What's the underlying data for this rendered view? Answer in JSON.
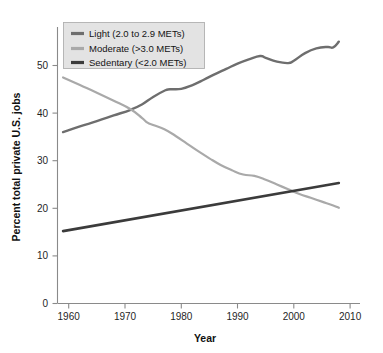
{
  "chart_data": {
    "type": "line",
    "title": "",
    "xlabel": "Year",
    "ylabel": "Percent total private U.S. jobs",
    "xlim": [
      1958,
      2010
    ],
    "ylim": [
      0,
      57
    ],
    "xticks": [
      1960,
      1970,
      1980,
      1990,
      2000,
      2010
    ],
    "xtick_labels": [
      "1960",
      "1970",
      "1980",
      "1990",
      "2000",
      "2010"
    ],
    "yticks": [
      0,
      10,
      20,
      30,
      40,
      50
    ],
    "ytick_labels": [
      "0",
      "10",
      "20",
      "30",
      "40",
      "50"
    ],
    "grid": false,
    "legend_position": "top-left",
    "series": [
      {
        "name": "Light (2.0 to 2.9 METs)",
        "color": "#6e6e6e",
        "x": [
          1959,
          1962,
          1965,
          1968,
          1971,
          1973,
          1975,
          1977,
          1978,
          1980,
          1982,
          1984,
          1986,
          1988,
          1990,
          1992,
          1994,
          1995,
          1997,
          1999,
          2000,
          2002,
          2004,
          2006,
          2007,
          2008
        ],
        "values": [
          36.0,
          37.2,
          38.3,
          39.5,
          40.7,
          41.8,
          43.4,
          44.7,
          45.0,
          45.1,
          45.9,
          47.0,
          48.2,
          49.3,
          50.4,
          51.3,
          52.0,
          51.6,
          50.8,
          50.5,
          51.0,
          52.6,
          53.6,
          53.9,
          53.8,
          55.0
        ]
      },
      {
        "name": "Moderate (>3.0 METs)",
        "color": "#a9a9a9",
        "x": [
          1959,
          1962,
          1965,
          1968,
          1971,
          1973,
          1974,
          1975,
          1977,
          1979,
          1981,
          1983,
          1985,
          1987,
          1989,
          1991,
          1993,
          1995,
          1997,
          1999,
          2001,
          2003,
          2005,
          2007,
          2008
        ],
        "values": [
          47.5,
          45.9,
          44.3,
          42.6,
          40.8,
          39.0,
          38.0,
          37.5,
          36.6,
          35.2,
          33.6,
          32.0,
          30.5,
          29.1,
          28.0,
          27.1,
          26.8,
          26.0,
          25.0,
          24.0,
          23.0,
          22.2,
          21.4,
          20.6,
          20.1
        ]
      },
      {
        "name": "Sedentary (<2.0 METs)",
        "color": "#3b3b3b",
        "x": [
          1959,
          2008
        ],
        "values": [
          15.2,
          25.3
        ]
      }
    ]
  },
  "legend": {
    "entries": [
      {
        "label": "Light (2.0 to 2.9 METs)",
        "color": "#6e6e6e"
      },
      {
        "label": "Moderate (>3.0 METs)",
        "color": "#a9a9a9"
      },
      {
        "label": "Sedentary (<2.0 METs)",
        "color": "#3b3b3b"
      }
    ]
  },
  "colors": {
    "background": "#ffffff",
    "axis": "#8a8a8a",
    "text": "#1a1a1a",
    "legend_background": "#e3e3e3",
    "legend_border": "#b0b0b0"
  }
}
